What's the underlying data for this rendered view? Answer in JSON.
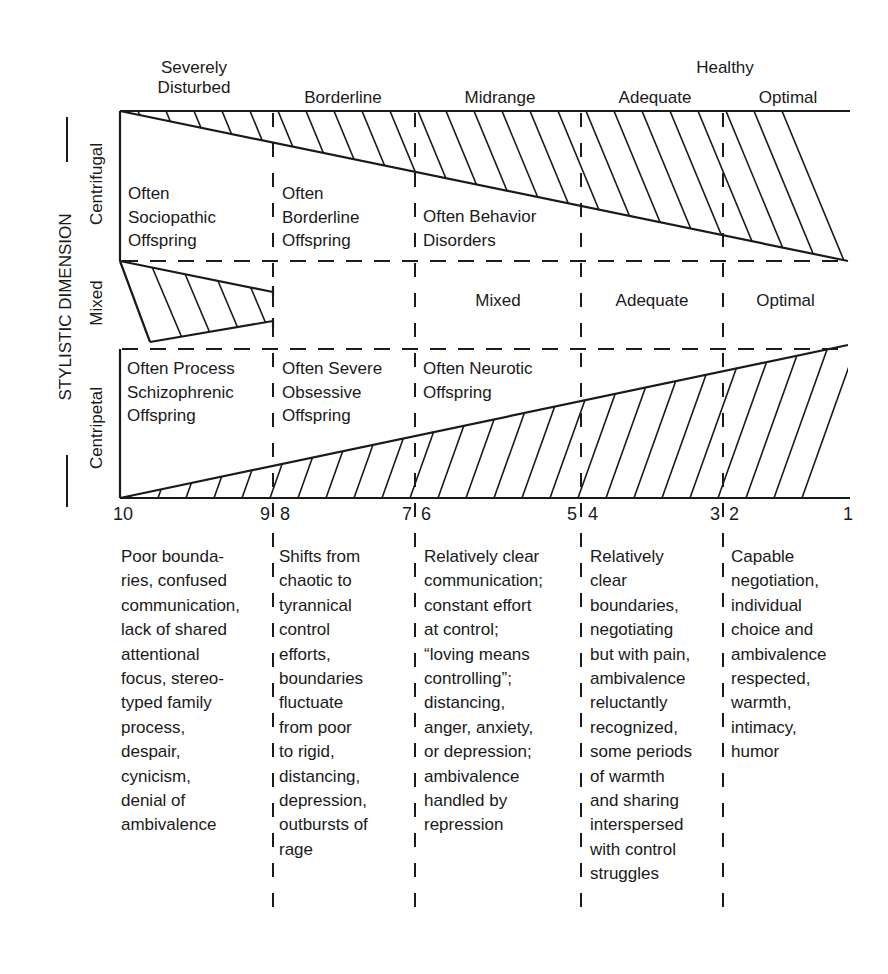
{
  "header": {
    "healthy_label": "Healthy",
    "columns": [
      {
        "label": "Severely\nDisturbed"
      },
      {
        "label": "Borderline"
      },
      {
        "label": "Midrange"
      },
      {
        "label": "Adequate"
      },
      {
        "label": "Optimal"
      }
    ]
  },
  "axis": {
    "title": "STYLISTIC DIMENSION",
    "rows": [
      {
        "label": "Centrifugal"
      },
      {
        "label": "Mixed"
      },
      {
        "label": "Centripetal"
      }
    ]
  },
  "centrifugal_cells": [
    {
      "text": "Often\nSociopathic\nOffspring"
    },
    {
      "text": "Often\nBorderline\nOffspring"
    },
    {
      "text": "Often Behavior\nDisorders"
    }
  ],
  "mixed_cells": [
    {
      "text": "Mixed"
    },
    {
      "text": "Adequate"
    },
    {
      "text": "Optimal"
    }
  ],
  "centripetal_cells": [
    {
      "text": "Often Process\nSchizophrenic\nOffspring"
    },
    {
      "text": "Often Severe\nObsessive\nOffspring"
    },
    {
      "text": "Often Neurotic\nOffspring"
    }
  ],
  "scale": {
    "ticks": [
      "10",
      "9",
      "8",
      "7",
      "6",
      "5",
      "4",
      "3",
      "2",
      "1"
    ]
  },
  "descriptions": [
    {
      "text": "Poor bounda-\nries, confused\ncommunication,\nlack of shared\nattentional\nfocus, stereo-\ntyped family\nprocess,\ndespair,\ncynicism,\ndenial of\nambivalence"
    },
    {
      "text": "Shifts from\nchaotic to\ntyrannical\ncontrol\nefforts,\nboundaries\nfluctuate\nfrom poor\nto rigid,\ndistancing,\ndepression,\noutbursts of\nrage"
    },
    {
      "text": "Relatively clear\ncommunication;\nconstant effort\nat control;\n“loving means\ncontrolling”;\ndistancing,\nanger, anxiety,\nor depression;\nambivalence\nhandled by\nrepression"
    },
    {
      "text": "Relatively\nclear\nboundaries,\nnegotiating\nbut with pain,\nambivalence\nreluctantly\nrecognized,\nsome periods\nof warmth\nand sharing\ninterspersed\nwith control\nstruggles"
    },
    {
      "text": "Capable\nnegotiation,\nindividual\nchoice and\nambivalence\nrespected,\nwarmth,\nintimacy,\nhumor"
    }
  ],
  "colors": {
    "ink": "#1a1a1a",
    "paper": "#ffffff"
  }
}
